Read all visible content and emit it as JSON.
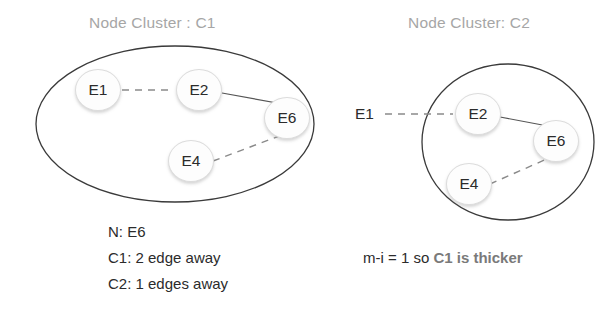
{
  "diagram": {
    "title_left": "Node Cluster : C1",
    "title_right": "Node Cluster: C2",
    "colors": {
      "title": "#a6a6a6",
      "node_stroke": "#dcdcdc",
      "node_fill": "#fdfdfd",
      "boundary_stroke": "#3a3a3a",
      "edge_solid": "#555555",
      "edge_dashed": "#8a8a8a",
      "text": "#2b2b2b",
      "emphasis": "#7a7a7a"
    },
    "clusters": [
      {
        "id": "C1",
        "shape": "ellipse",
        "title": "Node Cluster : C1",
        "nodes": [
          {
            "id": "E1",
            "label": "E1",
            "inside": true
          },
          {
            "id": "E2",
            "label": "E2",
            "inside": true
          },
          {
            "id": "E6",
            "label": "E6",
            "inside": true
          },
          {
            "id": "E4",
            "label": "E4",
            "inside": true
          }
        ],
        "edges": [
          {
            "from": "E1",
            "to": "E2",
            "style": "dashed"
          },
          {
            "from": "E2",
            "to": "E6",
            "style": "solid"
          },
          {
            "from": "E4",
            "to": "E6",
            "style": "dashed"
          }
        ]
      },
      {
        "id": "C2",
        "shape": "circle",
        "title": "Node Cluster: C2",
        "nodes": [
          {
            "id": "E1",
            "label": "E1",
            "inside": false
          },
          {
            "id": "E2",
            "label": "E2",
            "inside": true
          },
          {
            "id": "E6",
            "label": "E6",
            "inside": true
          },
          {
            "id": "E4",
            "label": "E4",
            "inside": true
          }
        ],
        "edges": [
          {
            "from": "E1",
            "to": "E2",
            "style": "dashed"
          },
          {
            "from": "E2",
            "to": "E6",
            "style": "solid"
          },
          {
            "from": "E4",
            "to": "E6",
            "style": "dashed"
          }
        ]
      }
    ],
    "captions": {
      "left": {
        "line1": "N: E6",
        "line2": "C1: 2 edge away",
        "line3": "C2: 1 edges away"
      },
      "right": {
        "prefix": "m-i = 1 so ",
        "emphasis": "C1 is thicker"
      }
    },
    "node_labels": {
      "c1_e1": "E1",
      "c1_e2": "E2",
      "c1_e6": "E6",
      "c1_e4": "E4",
      "c2_e1": "E1",
      "c2_e2": "E2",
      "c2_e6": "E6",
      "c2_e4": "E4"
    }
  }
}
